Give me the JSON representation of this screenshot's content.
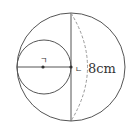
{
  "diagram": {
    "type": "circles-geometry",
    "labels": {
      "small_center": "ㄱ",
      "big_center": "ㄴ",
      "measurement": "8cm"
    },
    "colors": {
      "stroke": "#555555",
      "dashed": "#999999",
      "text": "#333333"
    }
  }
}
